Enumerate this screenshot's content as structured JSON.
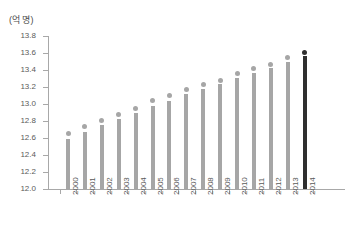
{
  "chart_data": {
    "type": "bar",
    "title": "",
    "subtitle": "",
    "unit_label": "(억 명)",
    "xlabel": "",
    "ylabel": "",
    "ylim": [
      12.0,
      13.8
    ],
    "ytick_step": 0.2,
    "grid": false,
    "legend": null,
    "highlight_category": "2014",
    "categories": [
      "2000",
      "2001",
      "2002",
      "2003",
      "2004",
      "2005",
      "2006",
      "2007",
      "2008",
      "2009",
      "2010",
      "2011",
      "2012",
      "2013",
      "2014"
    ],
    "ytick_labels": [
      "12.0",
      "12.2",
      "12.4",
      "12.6",
      "12.8",
      "13.0",
      "13.2",
      "13.4",
      "13.6",
      "13.8"
    ],
    "ytick_values": [
      12.0,
      12.2,
      12.4,
      12.6,
      12.8,
      13.0,
      13.2,
      13.4,
      13.6,
      13.8
    ],
    "series": [
      {
        "name": "인구",
        "values": [
          12.59,
          12.67,
          12.75,
          12.82,
          12.9,
          12.98,
          13.04,
          13.12,
          13.18,
          13.23,
          13.31,
          13.36,
          13.42,
          13.49,
          13.56
        ]
      }
    ],
    "marker_values": [
      12.65,
      12.73,
      12.81,
      12.88,
      12.95,
      13.04,
      13.1,
      13.17,
      13.23,
      13.28,
      13.36,
      13.42,
      13.47,
      13.55,
      13.61
    ],
    "colors": {
      "bar": "#a6a6a6",
      "bar_highlight": "#2f2f2f",
      "axis": "#a8a8a8",
      "text": "#5a5a5a",
      "background": "#ffffff"
    }
  }
}
